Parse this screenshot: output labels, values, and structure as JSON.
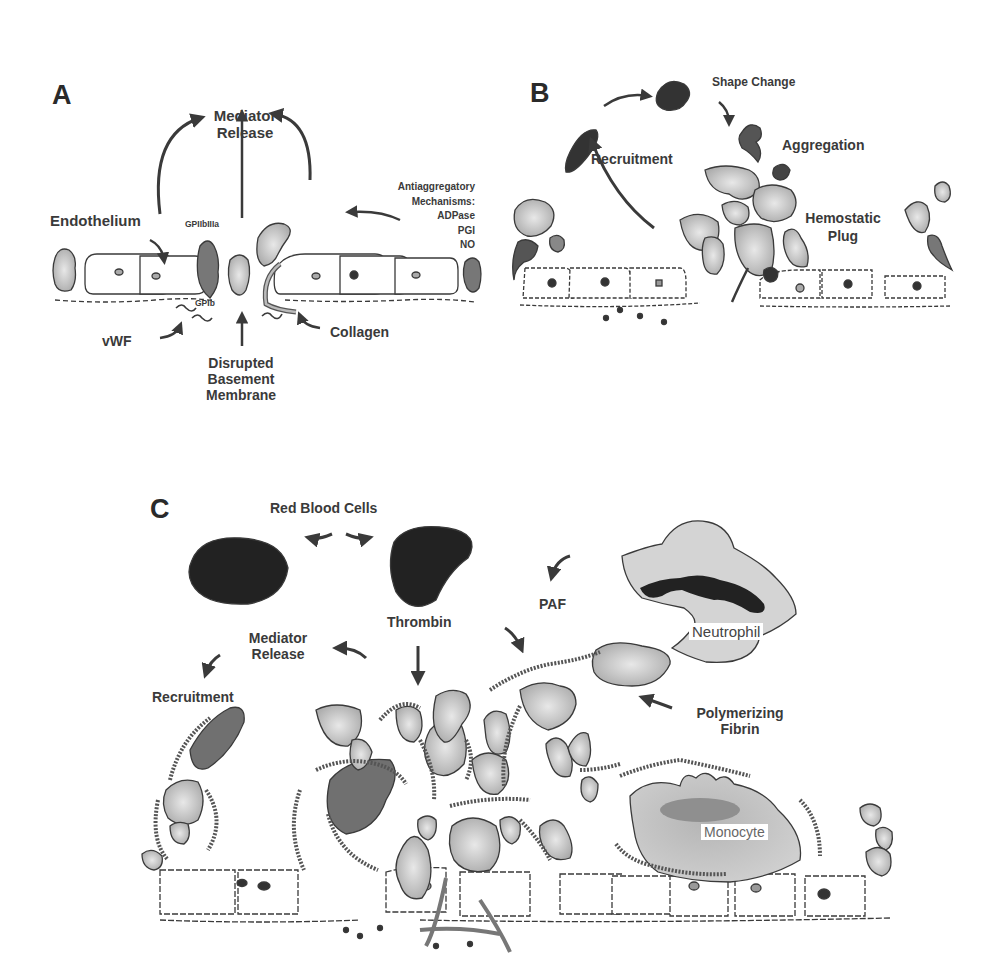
{
  "panels": {
    "A": {
      "letter": "A",
      "mediator_release": [
        "Mediator",
        "Release"
      ],
      "endothelium": "Endothelium",
      "gp2b3a": "GPIIbIIIa",
      "gp1b": "GPIb",
      "vwf": "vWF",
      "collagen": "Collagen",
      "disrupted": [
        "Disrupted",
        "Basement",
        "Membrane"
      ],
      "antiaggregatory": [
        "Antiaggregatory",
        "Mechanisms:",
        "ADPase",
        "PGI",
        "NO"
      ]
    },
    "B": {
      "letter": "B",
      "shape_change": "Shape Change",
      "aggregation": "Aggregation",
      "recruitment": "Recruitment",
      "hemostatic_plug": [
        "Hemostatic",
        "Plug"
      ]
    },
    "C": {
      "letter": "C",
      "red_blood_cells": "Red Blood Cells",
      "paf": "PAF",
      "thrombin": "Thrombin",
      "mediator_release": [
        "Mediator",
        "Release"
      ],
      "recruitment": "Recruitment",
      "neutrophil": "Neutrophil",
      "polymerizing_fibrin": [
        "Polymerizing",
        "Fibrin"
      ],
      "monocyte": "Monocyte"
    }
  },
  "colors": {
    "platelet_fill": "#b9b9b9",
    "rbc_fill": "#222222",
    "rbc_in_clot_fill": "#707070",
    "leukocyte_fill": "#d4d4d4",
    "endothelial_fill": "#ffffff",
    "stroke": "#3a3a3a"
  }
}
